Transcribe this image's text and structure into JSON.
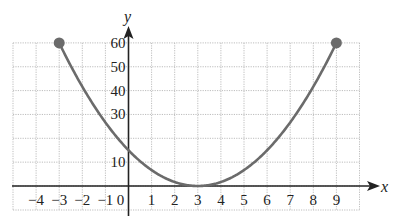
{
  "chart_data": {
    "type": "line",
    "title": "",
    "xlabel": "x",
    "ylabel": "y",
    "function": "y = (5/3)(x - 3)^2",
    "domain": [
      -3,
      9
    ],
    "x": [
      -3,
      -2,
      -1,
      0,
      1,
      2,
      3,
      4,
      5,
      6,
      7,
      8,
      9
    ],
    "y": [
      60,
      41.67,
      26.67,
      15,
      6.67,
      1.67,
      0,
      1.67,
      6.67,
      15,
      26.67,
      41.67,
      60
    ],
    "endpoints": [
      {
        "x": -3,
        "y": 60,
        "marker": "closed-dot"
      },
      {
        "x": 9,
        "y": 60,
        "marker": "closed-dot"
      }
    ],
    "xlim": [
      -5,
      10
    ],
    "ylim": [
      0,
      60
    ],
    "x_ticks": [
      -4,
      -3,
      -2,
      -1,
      0,
      1,
      2,
      3,
      4,
      5,
      6,
      7,
      8,
      9
    ],
    "x_tick_labels": [
      "−4",
      "−3",
      "−2",
      "−1",
      "0",
      "1",
      "2",
      "3",
      "4",
      "5",
      "6",
      "7",
      "8",
      "9"
    ],
    "y_ticks": [
      10,
      20,
      30,
      40,
      50,
      60
    ],
    "y_tick_labels": [
      "10",
      "20",
      "30",
      "40",
      "50",
      "60"
    ],
    "grid": true,
    "grid_style": "dotted",
    "legend": null,
    "colors": {
      "curve": "#6b6b6b",
      "axis": "#222222",
      "grid": "#bdbdbd",
      "text": "#222222"
    }
  },
  "labels": {
    "x_axis": "x",
    "y_axis": "y"
  }
}
